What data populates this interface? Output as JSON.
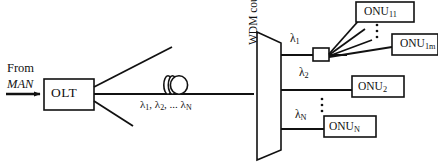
{
  "diagram": {
    "type": "wdm-pon-network",
    "source": {
      "line1": "From",
      "line2": "MAN"
    },
    "olt": {
      "label": "OLT"
    },
    "feeder_fiber": {
      "wavelengths_label": "λ1, λ2, ... λN"
    },
    "coupler": {
      "label": "WDM coupler"
    },
    "branches": [
      {
        "wavelength": "λ1",
        "has_splitter": true
      },
      {
        "wavelength": "λ2",
        "has_splitter": false
      },
      {
        "wavelength": "λN",
        "has_splitter": false
      }
    ],
    "onus": [
      {
        "label_base": "ONU",
        "subscript": "11"
      },
      {
        "label_base": "ONU",
        "subscript": "1m"
      },
      {
        "label_base": "ONU",
        "subscript": "2"
      },
      {
        "label_base": "ONU",
        "subscript": "N"
      }
    ],
    "ellipsis": {
      "glyph": "·"
    },
    "colors": {
      "stroke": "#111111",
      "fill": "#ffffff",
      "background": "#ffffff"
    }
  }
}
